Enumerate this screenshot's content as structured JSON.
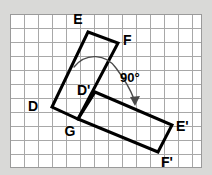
{
  "figure": {
    "type": "geometry-rotation-diagram",
    "background_color": "#d9d9d7",
    "plot_background_color": "#ffffff",
    "grid": {
      "visible": true,
      "line_color": "#a8a8a8",
      "cell_size_px": 14,
      "columns": 13,
      "rows": 11,
      "left": 10,
      "top": 14,
      "right": 202,
      "bottom": 168
    },
    "shape_color": "#000000",
    "shape_stroke_width": 3,
    "arc_color": "#000000",
    "labels": {
      "E": "E",
      "F": "F",
      "D": "D",
      "G": "G",
      "D_prime": "D'",
      "E_prime": "E'",
      "F_prime": "F'",
      "angle": "90°"
    },
    "original_rectangle": {
      "name": "DEFG",
      "vertices": [
        {
          "label": "D",
          "x": 52,
          "y": 107
        },
        {
          "label": "E",
          "x": 88,
          "y": 32
        },
        {
          "label": "F",
          "x": 118,
          "y": 43
        },
        {
          "label": "G",
          "x": 78,
          "y": 119
        }
      ]
    },
    "image_rectangle": {
      "name": "D'E'F'G",
      "vertices": [
        {
          "label": "G",
          "x": 78,
          "y": 119
        },
        {
          "label": "D_prime",
          "x": 95,
          "y": 92
        },
        {
          "label": "E_prime",
          "x": 172,
          "y": 125
        },
        {
          "label": "F_prime",
          "x": 158,
          "y": 152
        }
      ]
    },
    "rotation": {
      "angle_text": "90°",
      "angle_degrees": 90,
      "direction": "clockwise",
      "center_label": "G"
    },
    "label_positions": {
      "E": {
        "x": 78,
        "y": 24
      },
      "F": {
        "x": 123,
        "y": 45
      },
      "D": {
        "x": 33,
        "y": 111
      },
      "G": {
        "x": 70,
        "y": 136
      },
      "D_prime": {
        "x": 77,
        "y": 95
      },
      "E_prime": {
        "x": 176,
        "y": 131
      },
      "F_prime": {
        "x": 161,
        "y": 167
      },
      "angle": {
        "x": 120,
        "y": 82
      }
    }
  }
}
